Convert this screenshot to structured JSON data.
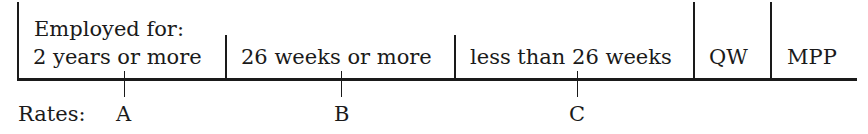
{
  "diagram": {
    "header_label": "Employed for:",
    "segments": [
      {
        "label": "2 years or more",
        "rate": "A"
      },
      {
        "label": "26 weeks or more",
        "rate": "B"
      },
      {
        "label": "less than 26 weeks",
        "rate": "C"
      },
      {
        "label": "QW"
      },
      {
        "label": "MPP"
      }
    ],
    "rates_label": "Rates:"
  }
}
